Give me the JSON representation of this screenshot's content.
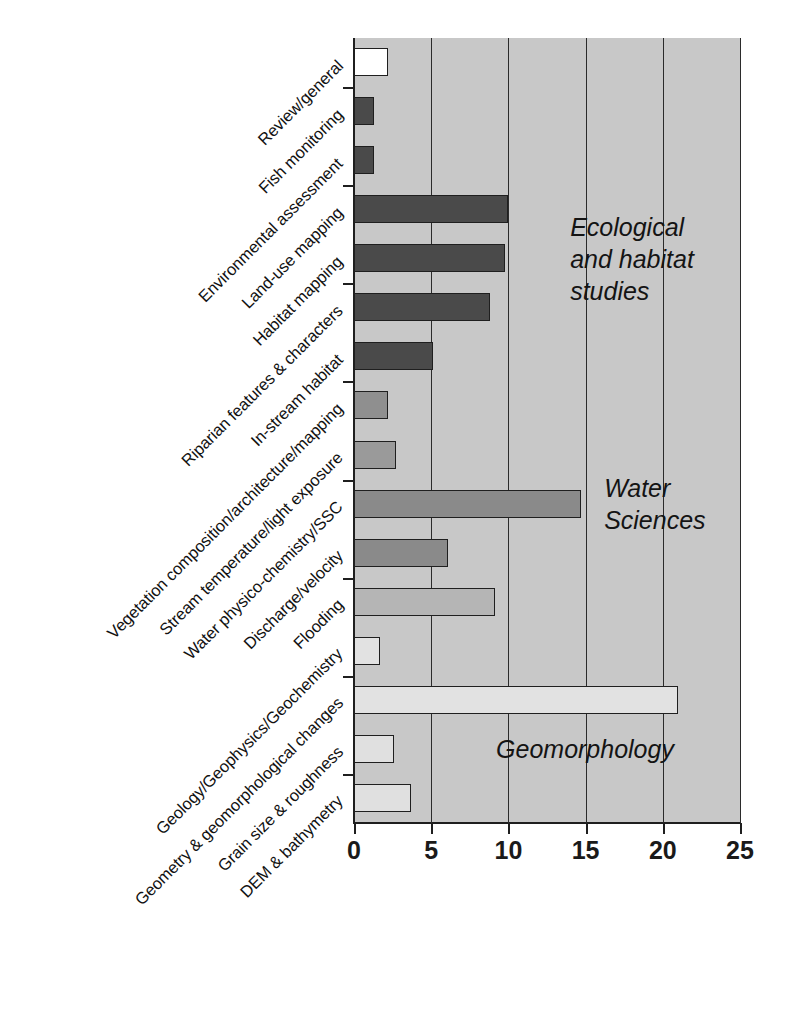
{
  "chart_data": {
    "type": "bar",
    "orientation": "horizontal",
    "title": "",
    "xlabel": "",
    "ylabel": "",
    "xlim": [
      0,
      25
    ],
    "xticks": [
      0,
      5,
      10,
      15,
      20,
      25
    ],
    "xticklabels": [
      "0",
      "5",
      "10",
      "15",
      "20",
      "25"
    ],
    "grid": "vertical",
    "legend": "none",
    "background": "#c8c8c8",
    "categories": [
      "Review/general",
      "Fish monitoring",
      "Environmental assessment",
      "Land-use mapping",
      "Habitat mapping",
      "Riparian features & characters",
      "In-stream habitat",
      "Vegetation composition/architecture/mapping",
      "Stream temperature/light exposure",
      "Water physico-chemistry/SSC",
      "Discharge/velocity",
      "Flooding",
      "Geology/Geophysics/Geochemistry",
      "Geometry & geomorphological changes",
      "Grain size & roughness",
      "DEM & bathymetry"
    ],
    "values": [
      2.2,
      1.3,
      1.3,
      10.0,
      9.8,
      8.8,
      5.1,
      2.2,
      2.7,
      14.7,
      6.1,
      9.1,
      1.7,
      21.0,
      2.6,
      3.7
    ],
    "bar_colors": [
      "#ffffff",
      "#4a4a4a",
      "#4a4a4a",
      "#4a4a4a",
      "#4a4a4a",
      "#4a4a4a",
      "#4a4a4a",
      "#8f8f8f",
      "#9a9a9a",
      "#8a8a8a",
      "#8a8a8a",
      "#b5b5b5",
      "#e2e2e2",
      "#e2e2e2",
      "#e0e0e0",
      "#e0e0e0"
    ],
    "annotations": [
      {
        "text": "Ecological\nand habitat\nstudies",
        "x": 14.0,
        "y_index": 4
      },
      {
        "text": "Water\nSciences",
        "x": 16.2,
        "y_index": 9
      },
      {
        "text": "Geomorphology",
        "x": 9.2,
        "y_index": 14
      }
    ]
  }
}
